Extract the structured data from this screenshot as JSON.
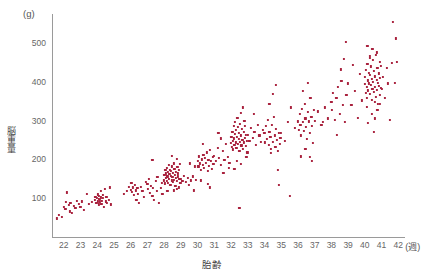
{
  "figure": {
    "y_unit_label": "(g)",
    "y_axis_title": "脳重量",
    "x_axis_title": "胎齢",
    "x_unit_label": "(週)",
    "point_color": "#a8203c",
    "axis_color": "#9a9a9a",
    "tick_text_color": "#666666"
  },
  "chart_data": {
    "type": "scatter",
    "title": "",
    "subtitle": "",
    "xlabel": "胎齢",
    "xunit": "(週)",
    "ylabel": "脳重量",
    "yunit": "(g)",
    "xlim": [
      21.3,
      42.4
    ],
    "ylim": [
      0,
      575
    ],
    "xticks": [
      22,
      23,
      24,
      25,
      26,
      27,
      28,
      29,
      30,
      31,
      32,
      33,
      34,
      35,
      36,
      37,
      38,
      39,
      40,
      41,
      42
    ],
    "yticks": [
      100,
      200,
      300,
      400,
      500
    ],
    "grid": false,
    "legend": null,
    "marker": "square",
    "marker_color": "#a8203c",
    "marker_size": 2.2,
    "points": [
      [
        21.6,
        48
      ],
      [
        21.7,
        58
      ],
      [
        21.9,
        52
      ],
      [
        22.0,
        78
      ],
      [
        22.1,
        72
      ],
      [
        22.15,
        90
      ],
      [
        22.2,
        115
      ],
      [
        22.3,
        82
      ],
      [
        22.35,
        66
      ],
      [
        22.4,
        88
      ],
      [
        22.5,
        62
      ],
      [
        22.6,
        80
      ],
      [
        22.7,
        74
      ],
      [
        22.8,
        94
      ],
      [
        22.9,
        86
      ],
      [
        23.0,
        78
      ],
      [
        23.1,
        92
      ],
      [
        23.2,
        70
      ],
      [
        23.4,
        112
      ],
      [
        23.5,
        86
      ],
      [
        23.7,
        90
      ],
      [
        23.85,
        96
      ],
      [
        23.9,
        104
      ],
      [
        23.95,
        88
      ],
      [
        24.0,
        100
      ],
      [
        24.02,
        92
      ],
      [
        24.05,
        110
      ],
      [
        24.08,
        84
      ],
      [
        24.1,
        98
      ],
      [
        24.12,
        106
      ],
      [
        24.15,
        90
      ],
      [
        24.18,
        96
      ],
      [
        24.2,
        118
      ],
      [
        24.22,
        102
      ],
      [
        24.25,
        86
      ],
      [
        24.3,
        94
      ],
      [
        24.32,
        108
      ],
      [
        24.35,
        100
      ],
      [
        24.4,
        78
      ],
      [
        24.45,
        124
      ],
      [
        24.5,
        92
      ],
      [
        24.55,
        104
      ],
      [
        24.6,
        88
      ],
      [
        24.7,
        96
      ],
      [
        24.75,
        128
      ],
      [
        24.8,
        84
      ],
      [
        25.6,
        112
      ],
      [
        25.8,
        118
      ],
      [
        25.9,
        130
      ],
      [
        26.0,
        122
      ],
      [
        26.05,
        140
      ],
      [
        26.1,
        116
      ],
      [
        26.15,
        128
      ],
      [
        26.2,
        108
      ],
      [
        26.25,
        134
      ],
      [
        26.3,
        120
      ],
      [
        26.35,
        96
      ],
      [
        26.4,
        126
      ],
      [
        26.45,
        112
      ],
      [
        26.5,
        88
      ],
      [
        26.6,
        130
      ],
      [
        26.7,
        118
      ],
      [
        26.8,
        104
      ],
      [
        26.9,
        142
      ],
      [
        27.0,
        136
      ],
      [
        27.05,
        124
      ],
      [
        27.1,
        150
      ],
      [
        27.15,
        114
      ],
      [
        27.2,
        132
      ],
      [
        27.3,
        106
      ],
      [
        27.35,
        126
      ],
      [
        27.4,
        96
      ],
      [
        27.5,
        144
      ],
      [
        27.55,
        118
      ],
      [
        27.6,
        154
      ],
      [
        27.7,
        88
      ],
      [
        27.8,
        126
      ],
      [
        27.85,
        140
      ],
      [
        27.9,
        112
      ],
      [
        27.3,
        198
      ],
      [
        28.0,
        146
      ],
      [
        28.02,
        160
      ],
      [
        28.05,
        138
      ],
      [
        28.08,
        172
      ],
      [
        28.1,
        152
      ],
      [
        28.12,
        164
      ],
      [
        28.15,
        144
      ],
      [
        28.18,
        178
      ],
      [
        28.2,
        156
      ],
      [
        28.22,
        168
      ],
      [
        28.25,
        140
      ],
      [
        28.28,
        186
      ],
      [
        28.3,
        150
      ],
      [
        28.32,
        162
      ],
      [
        28.35,
        174
      ],
      [
        28.38,
        134
      ],
      [
        28.4,
        158
      ],
      [
        28.42,
        170
      ],
      [
        28.45,
        146
      ],
      [
        28.48,
        182
      ],
      [
        28.5,
        154
      ],
      [
        28.52,
        166
      ],
      [
        28.55,
        142
      ],
      [
        28.58,
        190
      ],
      [
        28.6,
        148
      ],
      [
        28.62,
        176
      ],
      [
        28.65,
        160
      ],
      [
        28.68,
        132
      ],
      [
        28.7,
        168
      ],
      [
        28.72,
        152
      ],
      [
        28.75,
        202
      ],
      [
        28.78,
        144
      ],
      [
        28.8,
        180
      ],
      [
        28.82,
        156
      ],
      [
        28.85,
        164
      ],
      [
        28.88,
        128
      ],
      [
        28.9,
        172
      ],
      [
        28.92,
        150
      ],
      [
        28.95,
        188
      ],
      [
        28.98,
        140
      ],
      [
        28.45,
        210
      ],
      [
        28.6,
        120
      ],
      [
        28.75,
        124
      ],
      [
        28.2,
        118
      ],
      [
        29.0,
        150
      ],
      [
        29.1,
        144
      ],
      [
        29.2,
        158
      ],
      [
        29.3,
        142
      ],
      [
        29.4,
        152
      ],
      [
        29.5,
        134
      ],
      [
        29.6,
        146
      ],
      [
        29.7,
        156
      ],
      [
        29.8,
        120
      ],
      [
        29.9,
        148
      ],
      [
        29.55,
        190
      ],
      [
        29.85,
        182
      ],
      [
        30.0,
        196
      ],
      [
        30.05,
        182
      ],
      [
        30.1,
        208
      ],
      [
        30.15,
        190
      ],
      [
        30.2,
        174
      ],
      [
        30.25,
        200
      ],
      [
        30.3,
        186
      ],
      [
        30.35,
        212
      ],
      [
        30.4,
        178
      ],
      [
        30.45,
        204
      ],
      [
        30.5,
        192
      ],
      [
        30.55,
        218
      ],
      [
        30.6,
        170
      ],
      [
        30.65,
        198
      ],
      [
        30.7,
        184
      ],
      [
        30.75,
        224
      ],
      [
        30.8,
        196
      ],
      [
        30.85,
        176
      ],
      [
        30.9,
        206
      ],
      [
        30.95,
        188
      ],
      [
        30.3,
        240
      ],
      [
        30.6,
        136
      ],
      [
        30.75,
        128
      ],
      [
        30.2,
        146
      ],
      [
        31.0,
        210
      ],
      [
        31.1,
        196
      ],
      [
        31.2,
        230
      ],
      [
        31.3,
        204
      ],
      [
        31.4,
        186
      ],
      [
        31.5,
        222
      ],
      [
        31.6,
        198
      ],
      [
        31.7,
        240
      ],
      [
        31.8,
        206
      ],
      [
        31.9,
        192
      ],
      [
        31.25,
        268
      ],
      [
        31.55,
        166
      ],
      [
        31.85,
        178
      ],
      [
        31.4,
        254
      ],
      [
        32.0,
        242
      ],
      [
        32.02,
        258
      ],
      [
        32.05,
        232
      ],
      [
        32.08,
        272
      ],
      [
        32.1,
        248
      ],
      [
        32.12,
        226
      ],
      [
        32.15,
        286
      ],
      [
        32.18,
        254
      ],
      [
        32.2,
        238
      ],
      [
        32.22,
        266
      ],
      [
        32.25,
        296
      ],
      [
        32.28,
        244
      ],
      [
        32.3,
        276
      ],
      [
        32.32,
        230
      ],
      [
        32.35,
        258
      ],
      [
        32.38,
        308
      ],
      [
        32.4,
        240
      ],
      [
        32.42,
        284
      ],
      [
        32.45,
        252
      ],
      [
        32.48,
        268
      ],
      [
        32.5,
        222
      ],
      [
        32.52,
        292
      ],
      [
        32.55,
        246
      ],
      [
        32.58,
        320
      ],
      [
        32.6,
        262
      ],
      [
        32.62,
        236
      ],
      [
        32.65,
        278
      ],
      [
        32.68,
        250
      ],
      [
        32.7,
        334
      ],
      [
        32.72,
        228
      ],
      [
        32.75,
        270
      ],
      [
        32.78,
        244
      ],
      [
        32.8,
        300
      ],
      [
        32.82,
        256
      ],
      [
        32.85,
        286
      ],
      [
        32.88,
        234
      ],
      [
        32.9,
        264
      ],
      [
        32.92,
        206
      ],
      [
        32.95,
        248
      ],
      [
        32.98,
        218
      ],
      [
        32.35,
        196
      ],
      [
        32.6,
        188
      ],
      [
        32.2,
        176
      ],
      [
        32.5,
        76
      ],
      [
        33.0,
        264
      ],
      [
        33.1,
        248
      ],
      [
        33.2,
        282
      ],
      [
        33.3,
        256
      ],
      [
        33.4,
        270
      ],
      [
        33.5,
        238
      ],
      [
        33.6,
        290
      ],
      [
        33.7,
        262
      ],
      [
        33.8,
        246
      ],
      [
        33.9,
        276
      ],
      [
        33.35,
        318
      ],
      [
        34.0,
        268
      ],
      [
        34.05,
        244
      ],
      [
        34.1,
        286
      ],
      [
        34.15,
        252
      ],
      [
        34.2,
        302
      ],
      [
        34.25,
        238
      ],
      [
        34.3,
        272
      ],
      [
        34.35,
        258
      ],
      [
        34.4,
        228
      ],
      [
        34.45,
        290
      ],
      [
        34.5,
        246
      ],
      [
        34.55,
        310
      ],
      [
        34.6,
        262
      ],
      [
        34.65,
        232
      ],
      [
        34.7,
        278
      ],
      [
        34.75,
        250
      ],
      [
        34.8,
        222
      ],
      [
        34.85,
        268
      ],
      [
        34.9,
        240
      ],
      [
        34.95,
        256
      ],
      [
        34.3,
        344
      ],
      [
        34.5,
        368
      ],
      [
        34.7,
        392
      ],
      [
        34.4,
        216
      ],
      [
        34.8,
        172
      ],
      [
        34.85,
        134
      ],
      [
        35.0,
        268
      ],
      [
        35.2,
        248
      ],
      [
        35.4,
        296
      ],
      [
        35.6,
        334
      ],
      [
        35.8,
        282
      ],
      [
        35.5,
        106
      ],
      [
        36.0,
        298
      ],
      [
        36.05,
        276
      ],
      [
        36.1,
        318
      ],
      [
        36.15,
        288
      ],
      [
        36.2,
        262
      ],
      [
        36.25,
        330
      ],
      [
        36.3,
        296
      ],
      [
        36.35,
        274
      ],
      [
        36.4,
        344
      ],
      [
        36.45,
        306
      ],
      [
        36.5,
        284
      ],
      [
        36.55,
        252
      ],
      [
        36.6,
        322
      ],
      [
        36.65,
        298
      ],
      [
        36.7,
        268
      ],
      [
        36.75,
        358
      ],
      [
        36.8,
        310
      ],
      [
        36.85,
        286
      ],
      [
        36.9,
        242
      ],
      [
        36.95,
        328
      ],
      [
        36.3,
        376
      ],
      [
        36.6,
        398
      ],
      [
        36.45,
        228
      ],
      [
        36.7,
        206
      ],
      [
        36.85,
        196
      ],
      [
        36.2,
        208
      ],
      [
        37.0,
        300
      ],
      [
        37.2,
        324
      ],
      [
        37.4,
        290
      ],
      [
        37.6,
        334
      ],
      [
        37.8,
        306
      ],
      [
        37.5,
        296
      ],
      [
        38.0,
        348
      ],
      [
        38.05,
        328
      ],
      [
        38.1,
        372
      ],
      [
        38.2,
        302
      ],
      [
        38.3,
        358
      ],
      [
        38.4,
        386
      ],
      [
        38.5,
        318
      ],
      [
        38.6,
        402
      ],
      [
        38.7,
        340
      ],
      [
        38.8,
        296
      ],
      [
        38.9,
        366
      ],
      [
        38.55,
        432
      ],
      [
        38.75,
        460
      ],
      [
        38.85,
        502
      ],
      [
        38.35,
        264
      ],
      [
        39.0,
        396
      ],
      [
        39.2,
        340
      ],
      [
        39.4,
        376
      ],
      [
        39.6,
        308
      ],
      [
        39.8,
        352
      ],
      [
        39.3,
        444
      ],
      [
        39.7,
        420
      ],
      [
        40.0,
        394
      ],
      [
        40.02,
        412
      ],
      [
        40.05,
        372
      ],
      [
        40.08,
        430
      ],
      [
        40.1,
        388
      ],
      [
        40.12,
        358
      ],
      [
        40.15,
        446
      ],
      [
        40.18,
        404
      ],
      [
        40.2,
        378
      ],
      [
        40.22,
        424
      ],
      [
        40.25,
        396
      ],
      [
        40.28,
        462
      ],
      [
        40.3,
        368
      ],
      [
        40.32,
        418
      ],
      [
        40.35,
        392
      ],
      [
        40.38,
        440
      ],
      [
        40.4,
        354
      ],
      [
        40.42,
        408
      ],
      [
        40.45,
        382
      ],
      [
        40.48,
        456
      ],
      [
        40.5,
        400
      ],
      [
        40.52,
        374
      ],
      [
        40.55,
        428
      ],
      [
        40.58,
        348
      ],
      [
        40.6,
        414
      ],
      [
        40.62,
        386
      ],
      [
        40.65,
        470
      ],
      [
        40.68,
        362
      ],
      [
        40.7,
        406
      ],
      [
        40.72,
        380
      ],
      [
        40.75,
        436
      ],
      [
        40.78,
        398
      ],
      [
        40.8,
        344
      ],
      [
        40.82,
        422
      ],
      [
        40.85,
        390
      ],
      [
        40.88,
        452
      ],
      [
        40.9,
        366
      ],
      [
        40.92,
        410
      ],
      [
        40.95,
        384
      ],
      [
        40.98,
        442
      ],
      [
        40.15,
        492
      ],
      [
        40.45,
        484
      ],
      [
        40.7,
        476
      ],
      [
        40.3,
        466
      ],
      [
        40.1,
        336
      ],
      [
        40.4,
        318
      ],
      [
        40.6,
        306
      ],
      [
        40.75,
        328
      ],
      [
        40.9,
        344
      ],
      [
        40.2,
        294
      ],
      [
        40.55,
        270
      ],
      [
        41.0,
        382
      ],
      [
        41.1,
        412
      ],
      [
        41.2,
        358
      ],
      [
        41.3,
        436
      ],
      [
        41.4,
        396
      ],
      [
        41.5,
        302
      ],
      [
        41.6,
        448
      ],
      [
        41.7,
        554
      ],
      [
        41.8,
        398
      ],
      [
        41.85,
        512
      ],
      [
        41.9,
        452
      ]
    ]
  }
}
